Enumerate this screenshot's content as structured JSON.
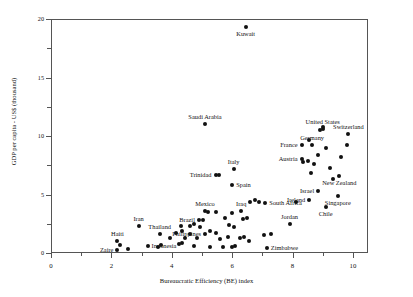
{
  "chart_data": {
    "type": "scatter",
    "title": "",
    "xlabel": "Bureaucratic Efficiency (BE) index",
    "ylabel": "GDP per capita - US$ (thousand)",
    "xlim": [
      0,
      10.5
    ],
    "ylim": [
      0,
      20
    ],
    "xticks": [
      0,
      2,
      4,
      6,
      8,
      10
    ],
    "xtick_labels": [
      "0",
      "2",
      "4",
      "6",
      "8",
      "10"
    ],
    "yticks": [
      0,
      5,
      10,
      15,
      20
    ],
    "ytick_labels": [
      "0",
      "5",
      "10",
      "15",
      "20"
    ],
    "grid": false,
    "legend": null,
    "points": [
      {
        "label": "Kuwait",
        "x": 6.45,
        "y": 19.3,
        "pos": "below"
      },
      {
        "label": "Saudi Arabia",
        "x": 5.1,
        "y": 11.0,
        "pos": "above"
      },
      {
        "label": "United States",
        "x": 9.0,
        "y": 10.6,
        "pos": "above"
      },
      {
        "label": "Switzerland",
        "x": 9.85,
        "y": 10.2,
        "pos": "above"
      },
      {
        "label": "Germany",
        "x": 8.65,
        "y": 9.2,
        "pos": "above"
      },
      {
        "label": "France",
        "x": 8.3,
        "y": 9.2,
        "pos": "left"
      },
      {
        "label": "Austria",
        "x": 8.3,
        "y": 8.0,
        "pos": "left"
      },
      {
        "label": "New Zealand",
        "x": 9.55,
        "y": 6.6,
        "pos": "below"
      },
      {
        "label": "Italy",
        "x": 6.05,
        "y": 7.2,
        "pos": "above"
      },
      {
        "label": "Trinidad",
        "x": 5.45,
        "y": 6.7,
        "pos": "left"
      },
      {
        "label": "Spain",
        "x": 6.0,
        "y": 5.8,
        "pos": "right"
      },
      {
        "label": "Israel",
        "x": 8.85,
        "y": 5.3,
        "pos": "left"
      },
      {
        "label": "Singapore",
        "x": 9.5,
        "y": 4.9,
        "pos": "below"
      },
      {
        "label": "Ireland",
        "x": 8.55,
        "y": 4.5,
        "pos": "left"
      },
      {
        "label": "South Africa",
        "x": 7.1,
        "y": 4.3,
        "pos": "right"
      },
      {
        "label": "Chile",
        "x": 9.1,
        "y": 3.9,
        "pos": "below"
      },
      {
        "label": "Mexico",
        "x": 5.1,
        "y": 3.6,
        "pos": "above"
      },
      {
        "label": "Iraq",
        "x": 6.3,
        "y": 3.6,
        "pos": "above"
      },
      {
        "label": "Brazil",
        "x": 4.9,
        "y": 2.8,
        "pos": "left"
      },
      {
        "label": "Jordan",
        "x": 7.9,
        "y": 2.5,
        "pos": "above"
      },
      {
        "label": "Iran",
        "x": 2.9,
        "y": 2.3,
        "pos": "above"
      },
      {
        "label": "Thailand",
        "x": 3.6,
        "y": 1.6,
        "pos": "above"
      },
      {
        "label": "Philippines",
        "x": 5.1,
        "y": 1.6,
        "pos": "left"
      },
      {
        "label": "Haiti",
        "x": 2.2,
        "y": 1.0,
        "pos": "above"
      },
      {
        "label": "Indonesia",
        "x": 3.2,
        "y": 0.6,
        "pos": "right"
      },
      {
        "label": "Zaire",
        "x": 2.2,
        "y": 0.25,
        "pos": "left"
      },
      {
        "label": "Zimbabwe",
        "x": 7.15,
        "y": 0.45,
        "pos": "right"
      }
    ],
    "unlabeled_points": [
      {
        "x": 8.55,
        "y": 9.7
      },
      {
        "x": 9.1,
        "y": 9.0
      },
      {
        "x": 9.8,
        "y": 9.2
      },
      {
        "x": 8.85,
        "y": 8.4
      },
      {
        "x": 9.6,
        "y": 8.2
      },
      {
        "x": 8.5,
        "y": 7.9
      },
      {
        "x": 8.35,
        "y": 7.8
      },
      {
        "x": 8.7,
        "y": 7.6
      },
      {
        "x": 9.25,
        "y": 7.3
      },
      {
        "x": 8.6,
        "y": 6.8
      },
      {
        "x": 9.0,
        "y": 10.8
      },
      {
        "x": 8.9,
        "y": 10.5
      },
      {
        "x": 9.35,
        "y": 6.3
      },
      {
        "x": 5.55,
        "y": 6.7
      },
      {
        "x": 6.6,
        "y": 4.4
      },
      {
        "x": 6.75,
        "y": 4.55
      },
      {
        "x": 6.9,
        "y": 4.4
      },
      {
        "x": 8.1,
        "y": 4.4
      },
      {
        "x": 5.45,
        "y": 3.5
      },
      {
        "x": 6.0,
        "y": 3.4
      },
      {
        "x": 5.2,
        "y": 3.5
      },
      {
        "x": 5.75,
        "y": 3.0
      },
      {
        "x": 6.35,
        "y": 2.9
      },
      {
        "x": 6.5,
        "y": 3.0
      },
      {
        "x": 5.05,
        "y": 2.8
      },
      {
        "x": 4.3,
        "y": 2.3
      },
      {
        "x": 4.6,
        "y": 2.3
      },
      {
        "x": 4.75,
        "y": 2.5
      },
      {
        "x": 4.95,
        "y": 2.2
      },
      {
        "x": 5.9,
        "y": 2.4
      },
      {
        "x": 6.05,
        "y": 2.2
      },
      {
        "x": 4.35,
        "y": 1.9
      },
      {
        "x": 5.25,
        "y": 1.9
      },
      {
        "x": 4.15,
        "y": 1.7
      },
      {
        "x": 4.6,
        "y": 1.6
      },
      {
        "x": 5.45,
        "y": 1.7
      },
      {
        "x": 3.95,
        "y": 1.3
      },
      {
        "x": 4.45,
        "y": 1.3
      },
      {
        "x": 4.85,
        "y": 1.3
      },
      {
        "x": 5.6,
        "y": 1.2
      },
      {
        "x": 6.25,
        "y": 1.25
      },
      {
        "x": 6.4,
        "y": 1.35
      },
      {
        "x": 2.3,
        "y": 0.7
      },
      {
        "x": 3.55,
        "y": 0.55
      },
      {
        "x": 3.65,
        "y": 0.7
      },
      {
        "x": 4.25,
        "y": 0.8
      },
      {
        "x": 4.35,
        "y": 0.85
      },
      {
        "x": 4.75,
        "y": 0.6
      },
      {
        "x": 5.25,
        "y": 0.55
      },
      {
        "x": 5.7,
        "y": 0.55
      },
      {
        "x": 6.0,
        "y": 0.5
      },
      {
        "x": 6.1,
        "y": 0.6
      },
      {
        "x": 6.55,
        "y": 1.0
      },
      {
        "x": 5.85,
        "y": 1.35
      },
      {
        "x": 2.55,
        "y": 0.3
      },
      {
        "x": 7.05,
        "y": 1.5
      },
      {
        "x": 7.3,
        "y": 1.6
      }
    ]
  }
}
